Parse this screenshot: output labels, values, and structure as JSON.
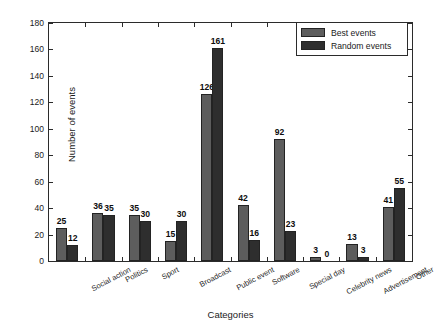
{
  "chart_data": {
    "type": "bar",
    "title": "",
    "xlabel": "Categories",
    "ylabel": "Number of events",
    "ylim": [
      0,
      180
    ],
    "ytick_step": 20,
    "yticks": [
      0,
      20,
      40,
      60,
      80,
      100,
      120,
      140,
      160,
      180
    ],
    "grid": false,
    "legend_position": "top-right",
    "categories": [
      "Social action",
      "Politics",
      "Sport",
      "Broadcast",
      "Public event",
      "Software",
      "Special day",
      "Celebrity news",
      "Advertisement",
      "Other"
    ],
    "series": [
      {
        "name": "Best events",
        "color": "#5d5d5d",
        "values": [
          25,
          36,
          35,
          15,
          126,
          42,
          92,
          3,
          13,
          41
        ]
      },
      {
        "name": "Random events",
        "color": "#2e2e2e",
        "values": [
          12,
          35,
          30,
          30,
          161,
          16,
          23,
          0,
          3,
          55
        ]
      }
    ]
  },
  "legend": {
    "items": [
      {
        "label": "Best events"
      },
      {
        "label": "Random events"
      }
    ]
  },
  "axes": {
    "y_title": "Number of events",
    "x_title": "Categories"
  }
}
